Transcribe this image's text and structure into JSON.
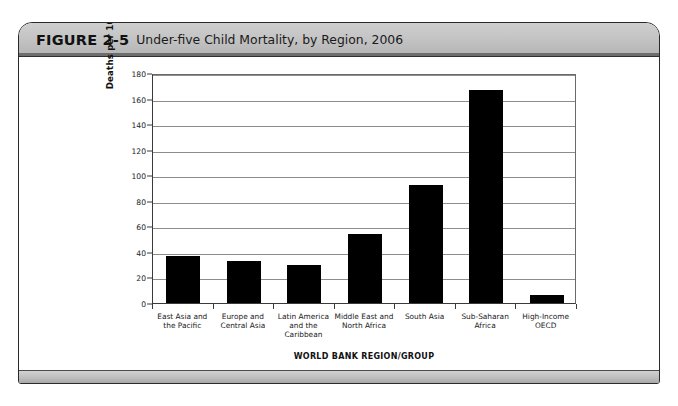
{
  "figure": {
    "number": "FIGURE 2-5",
    "title": "Under-five Child Mortality, by Region, 2006"
  },
  "chart_data": {
    "type": "bar",
    "title": "Under-five Child Mortality, by Region, 2006",
    "xlabel": "WORLD BANK REGION/GROUP",
    "ylabel": "Deaths per 1000 Live Births",
    "ylim": [
      0,
      180
    ],
    "yticks": [
      0,
      20,
      40,
      60,
      80,
      100,
      120,
      140,
      160,
      180
    ],
    "grid": true,
    "legend": "none",
    "bar_color": "#000000",
    "categories": [
      "East Asia and\nthe Pacific",
      "Europe and\nCentral Asia",
      "Latin America\nand the\nCaribbean",
      "Middle East and\nNorth Africa",
      "South Asia",
      "Sub-Saharan\nAfrica",
      "High-Income\nOECD"
    ],
    "values": [
      37,
      33,
      30,
      54,
      92,
      167,
      6
    ]
  }
}
